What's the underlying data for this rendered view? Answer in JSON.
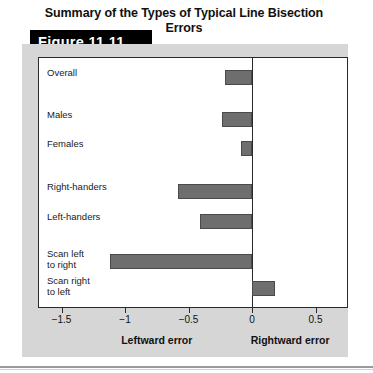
{
  "figure": {
    "number_label": "Figure 11.11",
    "title": "Summary of the Types of Typical Line Bisection Errors"
  },
  "axis": {
    "left_caption": "Leftward error",
    "right_caption": "Rightward error",
    "tick_labels": [
      "−1.5",
      "−1",
      "−0.5",
      "0",
      "0.5"
    ]
  },
  "colors": {
    "bar_fill": "#6e6e6e",
    "bar_stroke": "#4a4a4a",
    "panel_bg": "#d6d6d6",
    "plot_bg": "#ffffff",
    "axis": "#2a2a2a",
    "tab_bg": "#000000",
    "tab_text": "#ffffff"
  },
  "chart_data": {
    "type": "bar",
    "orientation": "horizontal",
    "title": "Summary of the Types of Typical Line Bisection Errors",
    "xlabel": "",
    "ylabel": "",
    "xlim": [
      -1.75,
      0.75
    ],
    "xticks": [
      -1.5,
      -1,
      -0.5,
      0,
      0.5
    ],
    "xtick_labels": [
      "−1.5",
      "−1",
      "−0.5",
      "0",
      "0.5"
    ],
    "grid": false,
    "legend": "none",
    "annotations": [
      "Leftward error",
      "Rightward error"
    ],
    "categories": [
      "Overall",
      "Males",
      "Females",
      "Right-handers",
      "Left-handers",
      "Scan left\nto right",
      "Scan right\nto left"
    ],
    "values": [
      -0.21,
      -0.24,
      -0.09,
      -0.58,
      -0.41,
      -1.12,
      0.18
    ]
  },
  "bars": [
    {
      "label": "Overall",
      "label_lines": "Overall",
      "value": -0.21,
      "row_top": 12,
      "label_top": 10
    },
    {
      "label": "Males",
      "label_lines": "Males",
      "value": -0.24,
      "row_top": 54,
      "label_top": 52
    },
    {
      "label": "Females",
      "label_lines": "Females",
      "value": -0.09,
      "row_top": 83,
      "label_top": 81
    },
    {
      "label": "Right-handers",
      "label_lines": "Right-handers",
      "value": -0.58,
      "row_top": 126,
      "label_top": 124
    },
    {
      "label": "Left-handers",
      "label_lines": "Left-handers",
      "value": -0.41,
      "row_top": 156,
      "label_top": 154
    },
    {
      "label": "Scan left to right",
      "label_lines": "Scan left\nto right",
      "value": -1.12,
      "row_top": 196,
      "label_top": 191
    },
    {
      "label": "Scan right to left",
      "label_lines": "Scan right\nto left",
      "value": 0.18,
      "row_top": 223,
      "label_top": 218
    }
  ]
}
